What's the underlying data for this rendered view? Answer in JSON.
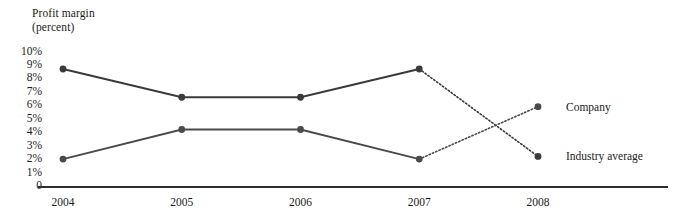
{
  "chart_data": {
    "type": "line",
    "title": "Profit margin",
    "subtitle": "(percent)",
    "ylabel": "Profit margin (percent)",
    "xlabel": "",
    "categories": [
      "2004",
      "2005",
      "2006",
      "2007",
      "2008"
    ],
    "x": [
      2004,
      2005,
      2006,
      2007,
      2008
    ],
    "ylim": [
      0,
      10
    ],
    "ytick_labels": [
      "10%",
      "9%",
      "8%",
      "7%",
      "6%",
      "5%",
      "4%",
      "3%",
      "2%",
      "1%",
      "0"
    ],
    "ytick_values": [
      10,
      9,
      8,
      7,
      6,
      5,
      4,
      3,
      2,
      1,
      0
    ],
    "grid": false,
    "legend_position": "right-inline",
    "series": [
      {
        "name": "Industry average",
        "values": [
          8.7,
          6.6,
          6.6,
          8.7,
          2.2
        ],
        "color": "#3a3a3a",
        "projected_from": "2007",
        "projected_style": "dotted"
      },
      {
        "name": "Company",
        "values": [
          2.0,
          4.2,
          4.2,
          2.0,
          5.9
        ],
        "color": "#4a4a4a",
        "projected_from": "2007",
        "projected_style": "dotted"
      }
    ],
    "annotations": [
      "Solid segments span 2004-2007; dotted segments span 2007-2008 (projection).",
      "The two series cross between 2007 and 2008."
    ]
  },
  "axis": {
    "title_line1": "Profit margin",
    "title_line2": "(percent)"
  },
  "labels": {
    "industry_average": "Industry average",
    "company": "Company"
  }
}
